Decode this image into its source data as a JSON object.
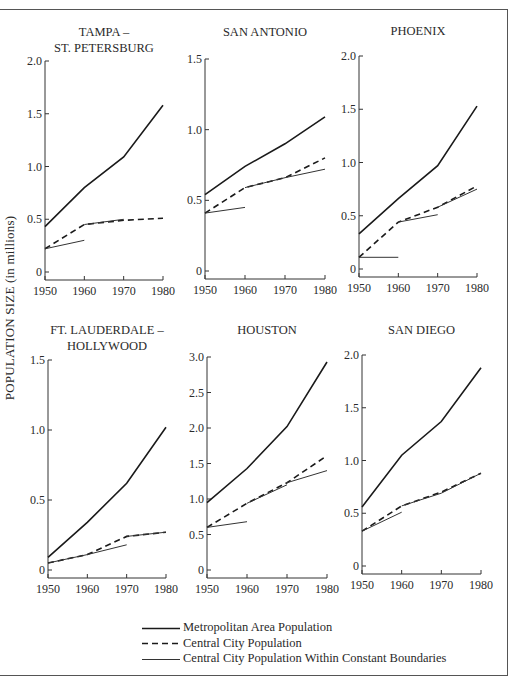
{
  "figure": {
    "y_axis_label": "POPULATION SIZE (in millions)",
    "legend": [
      {
        "label": "Metropolitan Area Population",
        "style": "solid-thick"
      },
      {
        "label": "Central City Population",
        "style": "dashed"
      },
      {
        "label": "Central City Population Within Constant Boundaries",
        "style": "solid-thin"
      }
    ]
  },
  "chart_data": [
    {
      "type": "line",
      "title": [
        "TAMPA –",
        "ST. PETERSBURG"
      ],
      "xlabel": "",
      "ylabel": "POPULATION SIZE (in millions)",
      "x": [
        1950,
        1960,
        1970,
        1980
      ],
      "xticks": [
        "1950",
        "1960",
        "1970",
        "1980"
      ],
      "ylim": [
        0,
        2.0
      ],
      "yticks": [
        "0",
        "0.5",
        "1.0",
        "1.5",
        "2.0"
      ],
      "ytick_values": [
        0,
        0.5,
        1.0,
        1.5,
        2.0
      ],
      "box": {
        "x0": 45,
        "x1": 163,
        "ytop": 61,
        "ybot": 272,
        "title_y": [
          36,
          52
        ]
      },
      "series": [
        {
          "name": "Metropolitan Area Population",
          "style": "solid-thick",
          "x": [
            1950,
            1960,
            1970,
            1980
          ],
          "values": [
            0.43,
            0.8,
            1.09,
            1.58
          ]
        },
        {
          "name": "Central City Population",
          "style": "dashed",
          "x": [
            1950,
            1960,
            1970,
            1980
          ],
          "values": [
            0.22,
            0.45,
            0.49,
            0.51
          ]
        },
        {
          "name": "Central City Population Within Constant Boundaries",
          "style": "solid-thin",
          "segments": [
            {
              "x": [
                1950,
                1960
              ],
              "values": [
                0.22,
                0.3
              ]
            },
            {
              "x": [
                1960,
                1970
              ],
              "values": [
                0.45,
                0.5
              ]
            }
          ]
        }
      ],
      "grid": false,
      "legend_position": "bottom"
    },
    {
      "type": "line",
      "title": [
        "SAN ANTONIO"
      ],
      "xlabel": "",
      "ylabel": "POPULATION SIZE (in millions)",
      "x": [
        1950,
        1960,
        1970,
        1980
      ],
      "xticks": [
        "1950",
        "1960",
        "1970",
        "1980"
      ],
      "ylim": [
        0,
        1.5
      ],
      "yticks": [
        "0",
        "0.5",
        "1.0",
        "1.5"
      ],
      "ytick_values": [
        0,
        0.5,
        1.0,
        1.5
      ],
      "box": {
        "x0": 205,
        "x1": 325,
        "ytop": 59,
        "ybot": 271,
        "title_y": [
          36
        ]
      },
      "series": [
        {
          "name": "Metropolitan Area Population",
          "style": "solid-thick",
          "x": [
            1950,
            1960,
            1970,
            1980
          ],
          "values": [
            0.54,
            0.74,
            0.9,
            1.09
          ]
        },
        {
          "name": "Central City Population",
          "style": "dashed",
          "x": [
            1950,
            1960,
            1970,
            1980
          ],
          "values": [
            0.41,
            0.59,
            0.66,
            0.8
          ]
        },
        {
          "name": "Central City Population Within Constant Boundaries",
          "style": "solid-thin",
          "segments": [
            {
              "x": [
                1950,
                1960
              ],
              "values": [
                0.41,
                0.45
              ]
            },
            {
              "x": [
                1960,
                1970,
                1980
              ],
              "values": [
                0.59,
                0.66,
                0.72
              ]
            }
          ]
        }
      ],
      "grid": false,
      "legend_position": "bottom"
    },
    {
      "type": "line",
      "title": [
        "PHOENIX"
      ],
      "xlabel": "",
      "ylabel": "POPULATION SIZE (in millions)",
      "x": [
        1950,
        1960,
        1970,
        1980
      ],
      "xticks": [
        "1950",
        "1960",
        "1970",
        "1980"
      ],
      "ylim": [
        0,
        2.0
      ],
      "yticks": [
        "0",
        "0.5",
        "1.0",
        "1.5",
        "2.0"
      ],
      "ytick_values": [
        0,
        0.5,
        1.0,
        1.5,
        2.0
      ],
      "box": {
        "x0": 359,
        "x1": 477,
        "ytop": 56,
        "ybot": 269,
        "title_y": [
          35
        ]
      },
      "series": [
        {
          "name": "Metropolitan Area Population",
          "style": "solid-thick",
          "x": [
            1950,
            1960,
            1970,
            1980
          ],
          "values": [
            0.33,
            0.66,
            0.97,
            1.53
          ]
        },
        {
          "name": "Central City Population",
          "style": "dashed",
          "x": [
            1950,
            1960,
            1970,
            1980
          ],
          "values": [
            0.11,
            0.44,
            0.58,
            0.78
          ]
        },
        {
          "name": "Central City Population Within Constant Boundaries",
          "style": "solid-thin",
          "segments": [
            {
              "x": [
                1950,
                1960
              ],
              "values": [
                0.11,
                0.11
              ]
            },
            {
              "x": [
                1960,
                1970
              ],
              "values": [
                0.44,
                0.51
              ]
            },
            {
              "x": [
                1970,
                1980
              ],
              "values": [
                0.58,
                0.75
              ]
            }
          ]
        }
      ],
      "grid": false,
      "legend_position": "bottom"
    },
    {
      "type": "line",
      "title": [
        "FT. LAUDERDALE –",
        "HOLLYWOOD"
      ],
      "xlabel": "",
      "ylabel": "POPULATION SIZE (in millions)",
      "x": [
        1950,
        1960,
        1970,
        1980
      ],
      "xticks": [
        "1950",
        "1960",
        "1970",
        "1980"
      ],
      "ylim": [
        0,
        1.5
      ],
      "yticks": [
        "0",
        "0.5",
        "1.0",
        "1.5"
      ],
      "ytick_values": [
        0,
        0.5,
        1.0,
        1.5
      ],
      "box": {
        "x0": 48,
        "x1": 166,
        "ytop": 360,
        "ybot": 570,
        "title_y": [
          334,
          350
        ]
      },
      "series": [
        {
          "name": "Metropolitan Area Population",
          "style": "solid-thick",
          "x": [
            1950,
            1960,
            1970,
            1980
          ],
          "values": [
            0.09,
            0.34,
            0.62,
            1.02
          ]
        },
        {
          "name": "Central City Population",
          "style": "dashed",
          "x": [
            1950,
            1960,
            1970,
            1980
          ],
          "values": [
            0.05,
            0.11,
            0.24,
            0.27
          ]
        },
        {
          "name": "Central City Population Within Constant Boundaries",
          "style": "solid-thin",
          "segments": [
            {
              "x": [
                1950,
                1960,
                1970
              ],
              "values": [
                0.05,
                0.11,
                0.18
              ]
            },
            {
              "x": [
                1970,
                1980
              ],
              "values": [
                0.24,
                0.27
              ]
            }
          ]
        }
      ],
      "grid": false,
      "legend_position": "bottom"
    },
    {
      "type": "line",
      "title": [
        "HOUSTON"
      ],
      "xlabel": "",
      "ylabel": "POPULATION SIZE (in millions)",
      "x": [
        1950,
        1960,
        1970,
        1980
      ],
      "xticks": [
        "1950",
        "1960",
        "1970",
        "1980"
      ],
      "ylim": [
        0,
        3.0
      ],
      "yticks": [
        "0",
        "0.5",
        "1.0",
        "1.5",
        "2.0",
        "2.5",
        "3.0"
      ],
      "ytick_values": [
        0,
        0.5,
        1.0,
        1.5,
        2.0,
        2.5,
        3.0
      ],
      "box": {
        "x0": 207,
        "x1": 327,
        "ytop": 357,
        "ybot": 570,
        "title_y": [
          334
        ]
      },
      "series": [
        {
          "name": "Metropolitan Area Population",
          "style": "solid-thick",
          "x": [
            1950,
            1960,
            1970,
            1980
          ],
          "values": [
            0.95,
            1.43,
            2.02,
            2.93
          ]
        },
        {
          "name": "Central City Population",
          "style": "dashed",
          "x": [
            1950,
            1960,
            1970,
            1980
          ],
          "values": [
            0.6,
            0.94,
            1.23,
            1.61
          ]
        },
        {
          "name": "Central City Population Within Constant Boundaries",
          "style": "solid-thin",
          "segments": [
            {
              "x": [
                1950,
                1960
              ],
              "values": [
                0.6,
                0.68
              ]
            },
            {
              "x": [
                1960,
                1970
              ],
              "values": [
                0.94,
                1.2
              ]
            },
            {
              "x": [
                1970,
                1980
              ],
              "values": [
                1.23,
                1.4
              ]
            }
          ]
        }
      ],
      "grid": false,
      "legend_position": "bottom"
    },
    {
      "type": "line",
      "title": [
        "SAN DIEGO"
      ],
      "xlabel": "",
      "ylabel": "POPULATION SIZE (in millions)",
      "x": [
        1950,
        1960,
        1970,
        1980
      ],
      "xticks": [
        "1950",
        "1960",
        "1970",
        "1980"
      ],
      "ylim": [
        0,
        2.0
      ],
      "yticks": [
        "0",
        "0.5",
        "1.0",
        "1.5",
        "2.0"
      ],
      "ytick_values": [
        0,
        0.5,
        1.0,
        1.5,
        2.0
      ],
      "box": {
        "x0": 362,
        "x1": 481,
        "ytop": 355,
        "ybot": 566,
        "title_y": [
          334
        ]
      },
      "series": [
        {
          "name": "Metropolitan Area Population",
          "style": "solid-thick",
          "x": [
            1950,
            1960,
            1970,
            1980
          ],
          "values": [
            0.56,
            1.05,
            1.37,
            1.88
          ]
        },
        {
          "name": "Central City Population",
          "style": "dashed",
          "x": [
            1950,
            1960,
            1970,
            1980
          ],
          "values": [
            0.33,
            0.57,
            0.7,
            0.88
          ]
        },
        {
          "name": "Central City Population Within Constant Boundaries",
          "style": "solid-thin",
          "segments": [
            {
              "x": [
                1950,
                1960
              ],
              "values": [
                0.33,
                0.51
              ]
            },
            {
              "x": [
                1960,
                1970,
                1980
              ],
              "values": [
                0.57,
                0.69,
                0.88
              ]
            }
          ]
        }
      ],
      "grid": false,
      "legend_position": "bottom"
    }
  ]
}
